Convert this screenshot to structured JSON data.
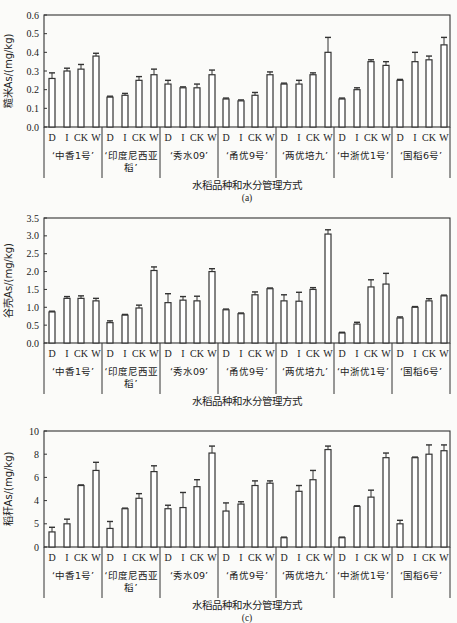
{
  "figure": {
    "shared": {
      "xlabel": "水稻品种和水分管理方式",
      "treatments": [
        "D",
        "I",
        "CK",
        "W"
      ],
      "varieties": [
        "‘中香1号’",
        "‘印度尼西亚稻’",
        "‘秀水09’",
        "‘甬优9号’",
        "‘两优培九’",
        "‘中浙优1号’",
        "‘国稻6号’"
      ],
      "variety_lines": [
        [
          "‘中香1号’"
        ],
        [
          "‘印度尼西亚",
          "稻’"
        ],
        [
          "‘秀水09’"
        ],
        [
          "‘甬优9号’"
        ],
        [
          "‘两优培九’"
        ],
        [
          "‘中浙优1号’"
        ],
        [
          "‘国稻6号’"
        ]
      ]
    }
  },
  "chart_data": [
    {
      "type": "bar",
      "panel_label": "(a)",
      "title": "",
      "xlabel": "水稻品种和水分管理方式",
      "ylabel": "糙米As/(mg/kg)",
      "ylim": [
        0,
        0.6
      ],
      "yticks": [
        "0.0",
        "0.1",
        "0.2",
        "0.3",
        "0.4",
        "0.5",
        "0.6"
      ],
      "grid": false,
      "legend": null,
      "categories": [
        "‘中香1号’",
        "‘印度尼西亚稻’",
        "‘秀水09’",
        "‘甬优9号’",
        "‘两优培九’",
        "‘中浙优1号’",
        "‘国稻6号’"
      ],
      "subcategories": [
        "D",
        "I",
        "CK",
        "W"
      ],
      "values": [
        [
          0.26,
          0.3,
          0.31,
          0.38
        ],
        [
          0.16,
          0.17,
          0.25,
          0.28
        ],
        [
          0.23,
          0.21,
          0.21,
          0.28
        ],
        [
          0.15,
          0.14,
          0.17,
          0.28
        ],
        [
          0.23,
          0.23,
          0.28,
          0.4
        ],
        [
          0.15,
          0.2,
          0.35,
          0.33
        ],
        [
          0.25,
          0.35,
          0.36,
          0.44
        ]
      ],
      "errors": [
        [
          0.03,
          0.015,
          0.025,
          0.015
        ],
        [
          0.005,
          0.01,
          0.02,
          0.03
        ],
        [
          0.02,
          0.005,
          0.02,
          0.025
        ],
        [
          0.005,
          0.005,
          0.015,
          0.015
        ],
        [
          0.005,
          0.02,
          0.01,
          0.08
        ],
        [
          0.005,
          0.01,
          0.01,
          0.02
        ],
        [
          0.005,
          0.05,
          0.02,
          0.04
        ]
      ]
    },
    {
      "type": "bar",
      "panel_label": "(b)",
      "title": "",
      "xlabel": "水稻品种和水分管理方式",
      "ylabel": "谷壳As/(mg/kg)",
      "ylim": [
        0,
        3.5
      ],
      "yticks": [
        "0.0",
        "0.5",
        "1.0",
        "1.5",
        "2.0",
        "2.5",
        "3.0",
        "3.5"
      ],
      "grid": false,
      "legend": null,
      "categories": [
        "‘中香1号’",
        "‘印度尼西亚稻’",
        "‘秀水09’",
        "‘甬优9号’",
        "‘两优培九’",
        "‘中浙优1号’",
        "‘国稻6号’"
      ],
      "subcategories": [
        "D",
        "I",
        "CK",
        "W"
      ],
      "values": [
        [
          0.87,
          1.25,
          1.25,
          1.18
        ],
        [
          0.57,
          0.78,
          0.98,
          2.03
        ],
        [
          1.13,
          1.2,
          1.18,
          2.0
        ],
        [
          0.93,
          0.82,
          1.35,
          1.52
        ],
        [
          1.18,
          1.17,
          1.5,
          3.05
        ],
        [
          0.28,
          0.53,
          1.57,
          1.65
        ],
        [
          0.7,
          1.0,
          1.18,
          1.32
        ]
      ],
      "errors": [
        [
          0.02,
          0.05,
          0.07,
          0.07
        ],
        [
          0.05,
          0.02,
          0.08,
          0.1
        ],
        [
          0.25,
          0.1,
          0.13,
          0.08
        ],
        [
          0.02,
          0.02,
          0.08,
          0.02
        ],
        [
          0.17,
          0.25,
          0.05,
          0.12
        ],
        [
          0.02,
          0.05,
          0.2,
          0.3
        ],
        [
          0.03,
          0.02,
          0.06,
          0.02
        ]
      ]
    },
    {
      "type": "bar",
      "panel_label": "(c)",
      "title": "",
      "xlabel": "水稻品种和水分管理方式",
      "ylabel": "稻秆As/(mg/kg)",
      "ylim": [
        0,
        10
      ],
      "yticks": [
        "0",
        "5",
        "4",
        "6",
        "8",
        "10"
      ],
      "grid": false,
      "legend": null,
      "categories": [
        "‘中香1号’",
        "‘印度尼西亚稻’",
        "‘秀水09’",
        "‘甬优9号’",
        "‘两优培九’",
        "‘中浙优1号’",
        "‘国稻6号’"
      ],
      "subcategories": [
        "D",
        "I",
        "CK",
        "W"
      ],
      "values": [
        [
          1.3,
          2.0,
          5.3,
          6.6
        ],
        [
          1.6,
          3.3,
          4.2,
          6.5
        ],
        [
          3.3,
          3.4,
          5.2,
          8.1
        ],
        [
          3.1,
          3.7,
          5.3,
          5.5
        ],
        [
          0.8,
          4.8,
          5.8,
          8.4
        ],
        [
          0.8,
          3.5,
          4.3,
          7.7
        ],
        [
          2.0,
          7.7,
          8.0,
          8.3
        ]
      ],
      "errors": [
        [
          0.4,
          0.4,
          0.05,
          0.7
        ],
        [
          0.6,
          0.05,
          0.4,
          0.5
        ],
        [
          0.3,
          1.3,
          0.6,
          0.6
        ],
        [
          0.7,
          0.2,
          0.4,
          0.2
        ],
        [
          0.05,
          0.5,
          0.8,
          0.3
        ],
        [
          0.05,
          0.05,
          0.6,
          0.4
        ],
        [
          0.3,
          0.05,
          0.8,
          0.5
        ]
      ]
    }
  ]
}
